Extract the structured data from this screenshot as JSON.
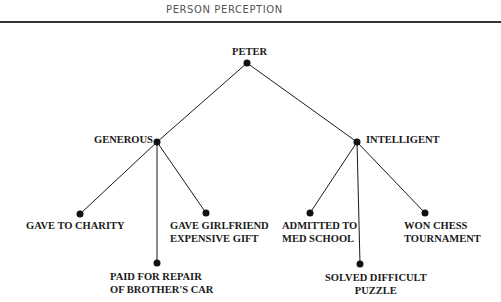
{
  "header": {
    "title": "PERSON PERCEPTION"
  },
  "tree": {
    "root": {
      "label": "PETER"
    },
    "traits": [
      {
        "label": "GENEROUS",
        "behaviors": [
          {
            "lines": [
              "GAVE TO CHARITY"
            ]
          },
          {
            "lines": [
              "PAID FOR REPAIR",
              "OF BROTHER'S CAR"
            ]
          },
          {
            "lines": [
              "GAVE GIRLFRIEND",
              "EXPENSIVE GIFT"
            ]
          }
        ]
      },
      {
        "label": "INTELLIGENT",
        "behaviors": [
          {
            "lines": [
              "ADMITTED TO",
              "MED SCHOOL"
            ]
          },
          {
            "lines": [
              "SOLVED DIFFICULT",
              "PUZZLE"
            ]
          },
          {
            "lines": [
              "WON CHESS",
              "TOURNAMENT"
            ]
          }
        ]
      }
    ]
  },
  "style": {
    "line_color": "#1a1a1a",
    "node_color": "#111111"
  }
}
